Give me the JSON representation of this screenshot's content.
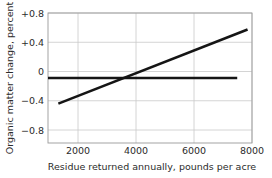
{
  "chart_data": {
    "type": "line",
    "title": "",
    "xlabel": "Residue returned annually, pounds per acre",
    "ylabel": "Organic matter change, percent",
    "xlim": [
      1100,
      8000
    ],
    "ylim": [
      -0.95,
      0.95
    ],
    "xticks": [
      2000,
      4000,
      6000,
      8000
    ],
    "xtick_labels": [
      "2000",
      "4000",
      "6000",
      "8000"
    ],
    "yticks": [
      0.8,
      0.4,
      0,
      -0.4,
      -0.8
    ],
    "ytick_labels": [
      "+0.8",
      "+0.4",
      "0",
      "−0.4",
      "−0.8"
    ],
    "grid": true,
    "legend": "none",
    "series": [
      {
        "name": "organic-matter-change-trend",
        "type": "line",
        "color": "#151515",
        "linewidth": 2.6,
        "points": [
          {
            "x": 1450,
            "y": -0.375
          },
          {
            "x": 3600,
            "y": 0.0
          },
          {
            "x": 7850,
            "y": 0.71
          }
        ]
      },
      {
        "name": "zero-reference-line",
        "type": "line",
        "color": "#151515",
        "linewidth": 2.6,
        "points": [
          {
            "x": 1100,
            "y": 0.0
          },
          {
            "x": 7500,
            "y": 0.0
          }
        ]
      }
    ],
    "annotations": []
  },
  "axes": {
    "x_title": "Residue returned annually, pounds per acre",
    "y_title": "Organic matter change, percent"
  },
  "colors": {
    "data_line": "#151515",
    "gridline": "#c9c9c9",
    "frame": "#9a9a9a",
    "text": "#2b2b2b",
    "background": "#ffffff"
  }
}
